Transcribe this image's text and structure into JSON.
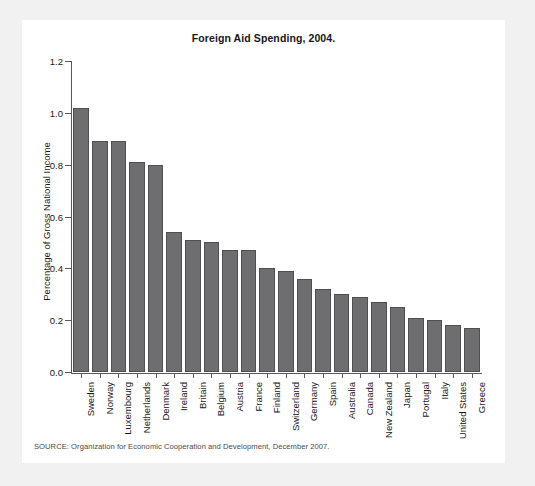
{
  "figure": {
    "title": "Foreign Aid Spending, 2004.",
    "source_note": "SOURCE: Organization for Economic Cooperation and Development, December 2007.",
    "bar_color": "#6e6e70",
    "bar_edge_color": "#4f4f51",
    "axis_color": "#58585a",
    "card_background": "#ffffff",
    "page_background": "#f1f1f1"
  },
  "chart_data": {
    "type": "bar",
    "title": "Foreign Aid Spending, 2004.",
    "xlabel": "",
    "ylabel": "Percentage of Gross National Income",
    "ylim": [
      0.0,
      1.2
    ],
    "yticks": [
      "0.0",
      "0.2",
      "0.4",
      "0.6",
      "0.8",
      "1.0",
      "1.2"
    ],
    "ytick_values": [
      0.0,
      0.2,
      0.4,
      0.6,
      0.8,
      1.0,
      1.2
    ],
    "grid": false,
    "legend": false,
    "categories": [
      "Sweden",
      "Norway",
      "Luxembourg",
      "Netherlands",
      "Denmark",
      "Ireland",
      "Britain",
      "Belgium",
      "Austria",
      "France",
      "Finland",
      "Switzerland",
      "Germany",
      "Spain",
      "Australia",
      "Canada",
      "New Zealand",
      "Japan",
      "Portugal",
      "Italy",
      "United States",
      "Greece"
    ],
    "values": [
      1.02,
      0.89,
      0.89,
      0.81,
      0.8,
      0.54,
      0.51,
      0.5,
      0.47,
      0.47,
      0.4,
      0.39,
      0.36,
      0.32,
      0.3,
      0.29,
      0.27,
      0.25,
      0.21,
      0.2,
      0.18,
      0.17
    ]
  }
}
